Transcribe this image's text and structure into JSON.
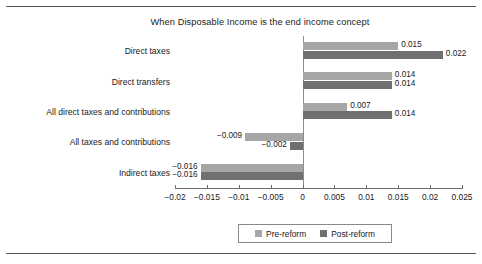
{
  "figure": {
    "top_rule": true,
    "bottom_rule": true,
    "background": "#ffffff"
  },
  "legend": {
    "position": "bottom-center",
    "items": [
      {
        "label": "Pre-reform",
        "color": "#a6a6a6"
      },
      {
        "label": "Post-reform",
        "color": "#707070"
      }
    ]
  },
  "chart_data": {
    "type": "bar",
    "orientation": "horizontal",
    "title": "When Disposable Income is the end income concept",
    "xlabel": "",
    "ylabel": "",
    "xlim": [
      -0.02,
      0.025
    ],
    "grid": false,
    "zero_line": true,
    "categories": [
      "Direct taxes",
      "Direct transfers",
      "All direct taxes and contributions",
      "All taxes and contributions",
      "Indirect taxes"
    ],
    "tick_values": [
      -0.02,
      -0.015,
      -0.01,
      -0.005,
      0,
      0.005,
      0.01,
      0.015,
      0.02,
      0.025
    ],
    "tick_labels": [
      "−0.02",
      "−0.015",
      "−0.01",
      "−0.005",
      "0",
      "0.005",
      "0.01",
      "0.015",
      "0.02",
      "0.025"
    ],
    "series": [
      {
        "name": "Pre-reform",
        "color": "#a6a6a6",
        "values": [
          0.015,
          0.014,
          0.007,
          -0.009,
          -0.016
        ],
        "data_labels": [
          "0.015",
          "0.014",
          "0.007",
          "−0.009",
          "−0.016"
        ]
      },
      {
        "name": "Post-reform",
        "color": "#707070",
        "values": [
          0.022,
          0.014,
          0.014,
          -0.002,
          -0.016
        ],
        "data_labels": [
          "0.022",
          "0.014",
          "0.014",
          "−0.002",
          "−0.016"
        ]
      }
    ]
  }
}
